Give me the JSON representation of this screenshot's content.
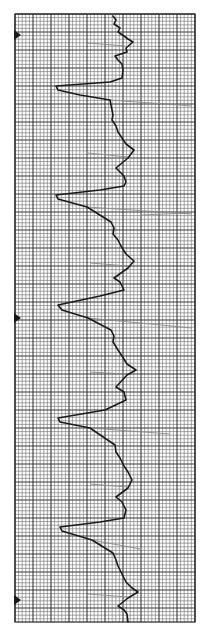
{
  "figure": {
    "kind": "ecg-rhythm-strip",
    "orientation": "vertical",
    "background_color": "#ffffff",
    "grid_color": "#3a3a3a",
    "trace_color": "#1a1a1a",
    "faint_trace_color": "#8a8a8a",
    "marker_color": "#1a1a1a"
  },
  "grid": {
    "x0": 15,
    "y0": 14,
    "x1": 195,
    "y1": 622,
    "minor_step": 3.6,
    "major_every": 5
  },
  "markers": [
    {
      "label": "marker-1",
      "y": 35
    },
    {
      "label": "marker-2",
      "y": 318
    },
    {
      "label": "marker-3",
      "y": 600
    }
  ],
  "chart_data": {
    "type": "line",
    "title": "",
    "xlabel": "",
    "ylabel": "",
    "grid": true,
    "legend": "none",
    "beat_count": 6,
    "trace_points": [
      [
        113,
        16
      ],
      [
        116,
        20
      ],
      [
        114,
        24
      ],
      [
        120,
        28
      ],
      [
        118,
        32
      ],
      [
        124,
        36
      ],
      [
        128,
        39
      ],
      [
        133,
        42
      ],
      [
        126,
        48
      ],
      [
        127,
        52
      ],
      [
        115,
        56
      ],
      [
        118,
        60
      ],
      [
        122,
        64
      ],
      [
        123,
        70
      ],
      [
        122,
        78
      ],
      [
        110,
        82
      ],
      [
        56,
        86
      ],
      [
        58,
        90
      ],
      [
        80,
        95
      ],
      [
        110,
        100
      ],
      [
        113,
        115
      ],
      [
        112,
        120
      ],
      [
        116,
        126
      ],
      [
        118,
        132
      ],
      [
        122,
        138
      ],
      [
        126,
        144
      ],
      [
        134,
        150
      ],
      [
        128,
        158
      ],
      [
        116,
        168
      ],
      [
        120,
        172
      ],
      [
        124,
        176
      ],
      [
        126,
        182
      ],
      [
        124,
        186
      ],
      [
        100,
        190
      ],
      [
        56,
        195
      ],
      [
        58,
        199
      ],
      [
        87,
        207
      ],
      [
        111,
        222
      ],
      [
        114,
        228
      ],
      [
        113,
        234
      ],
      [
        118,
        240
      ],
      [
        121,
        246
      ],
      [
        126,
        254
      ],
      [
        134,
        261
      ],
      [
        128,
        268
      ],
      [
        114,
        278
      ],
      [
        120,
        282
      ],
      [
        122,
        286
      ],
      [
        124,
        290
      ],
      [
        100,
        296
      ],
      [
        58,
        305
      ],
      [
        62,
        310
      ],
      [
        88,
        318
      ],
      [
        111,
        330
      ],
      [
        114,
        336
      ],
      [
        113,
        342
      ],
      [
        118,
        350
      ],
      [
        122,
        356
      ],
      [
        127,
        364
      ],
      [
        136,
        370
      ],
      [
        127,
        375
      ],
      [
        116,
        387
      ],
      [
        124,
        392
      ],
      [
        126,
        400
      ],
      [
        105,
        410
      ],
      [
        58,
        418
      ],
      [
        60,
        422
      ],
      [
        90,
        428
      ],
      [
        115,
        445
      ],
      [
        116,
        452
      ],
      [
        120,
        458
      ],
      [
        124,
        466
      ],
      [
        128,
        472
      ],
      [
        132,
        480
      ],
      [
        128,
        488
      ],
      [
        116,
        497
      ],
      [
        122,
        502
      ],
      [
        126,
        510
      ],
      [
        124,
        518
      ],
      [
        100,
        522
      ],
      [
        60,
        527
      ],
      [
        62,
        531
      ],
      [
        92,
        540
      ],
      [
        113,
        553
      ],
      [
        116,
        560
      ],
      [
        118,
        566
      ],
      [
        122,
        574
      ],
      [
        126,
        582
      ],
      [
        132,
        588
      ],
      [
        138,
        592
      ],
      [
        128,
        598
      ],
      [
        118,
        606
      ],
      [
        124,
        610
      ],
      [
        127,
        614
      ],
      [
        128,
        622
      ]
    ],
    "faint_strokes": [
      [
        [
          88,
          43
        ],
        [
          125,
          46
        ]
      ],
      [
        [
          110,
          100
        ],
        [
          192,
          106
        ]
      ],
      [
        [
          88,
          153
        ],
        [
          128,
          157
        ]
      ],
      [
        [
          87,
          207
        ],
        [
          192,
          214
        ]
      ],
      [
        [
          140,
          215
        ],
        [
          190,
          213
        ]
      ],
      [
        [
          90,
          263
        ],
        [
          128,
          266
        ]
      ],
      [
        [
          88,
          318
        ],
        [
          192,
          328
        ]
      ],
      [
        [
          90,
          372
        ],
        [
          126,
          374
        ]
      ],
      [
        [
          90,
          428
        ],
        [
          170,
          434
        ]
      ],
      [
        [
          90,
          484
        ],
        [
          128,
          487
        ]
      ],
      [
        [
          92,
          540
        ],
        [
          140,
          549
        ]
      ],
      [
        [
          88,
          594
        ],
        [
          128,
          597
        ]
      ]
    ]
  }
}
